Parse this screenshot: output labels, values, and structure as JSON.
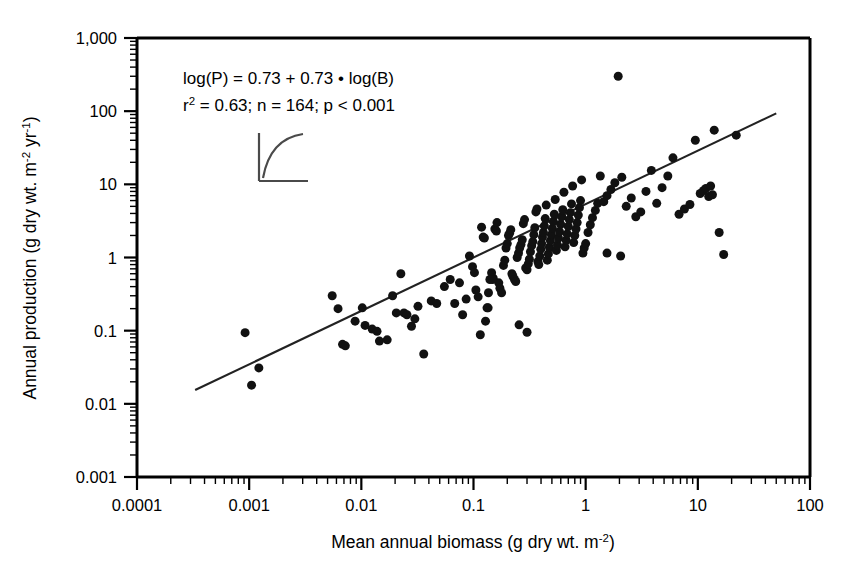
{
  "figure": {
    "background_color": "#ffffff",
    "ink_color": "#000000"
  },
  "annotation": {
    "equation": "log(P) = 0.73 + 0.73 • log(B)",
    "stats_r2_label": "r",
    "stats_r2_exponent": "2",
    "stats_rest": " = 0.63; n = 164; p < 0.001",
    "stats_full": "r2 = 0.63; n = 164; p < 0.001"
  },
  "inset": {
    "name": "saturating-curve-inset",
    "description": "small axes with a saturating (decelerating) curve"
  },
  "chart_data": {
    "type": "scatter",
    "title": "",
    "xlabel_parts": {
      "main": "Mean annual biomass (g dry wt. m",
      "exp": "-2",
      "tail": ")"
    },
    "ylabel_parts": {
      "main": "Annual production (g dry wt. m",
      "exp1": "-2",
      "mid": " yr",
      "exp2": "-1",
      "tail": ")"
    },
    "xlabel": "Mean annual biomass (g dry wt. m-2)",
    "ylabel": "Annual production (g dry wt. m-2 yr-1)",
    "xscale": "log",
    "yscale": "log",
    "xlim": [
      0.0001,
      100
    ],
    "ylim": [
      0.001,
      1000
    ],
    "xticks": [
      0.0001,
      0.001,
      0.01,
      0.1,
      1,
      10,
      100
    ],
    "xtick_labels": [
      "0.0001",
      "0.001",
      "0.01",
      "0.1",
      "1",
      "10",
      "100"
    ],
    "yticks": [
      0.001,
      0.01,
      0.1,
      1,
      10,
      100,
      1000
    ],
    "ytick_labels": [
      "0.001",
      "0.01",
      "0.1",
      "1",
      "10",
      "100",
      "1,000"
    ],
    "grid": false,
    "legend": false,
    "minor_ticks": true,
    "marker": {
      "shape": "circle",
      "color": "#111111",
      "size_px": 9
    },
    "fit_line": {
      "name": "regression-line",
      "equation": "log(P) = 0.73 + 0.73 * log(B)",
      "intercept": 0.73,
      "slope": 0.73,
      "r2": 0.63,
      "n": 164,
      "p": "< 0.001",
      "x_start": 0.00033,
      "x_end": 50.0,
      "color": "#222222"
    },
    "points": [
      [
        0.00092,
        0.094
      ],
      [
        0.00105,
        0.018
      ],
      [
        0.00122,
        0.031
      ],
      [
        0.0055,
        0.3
      ],
      [
        0.0062,
        0.2
      ],
      [
        0.0068,
        0.065
      ],
      [
        0.0072,
        0.062
      ],
      [
        0.0088,
        0.135
      ],
      [
        0.0102,
        0.205
      ],
      [
        0.0108,
        0.118
      ],
      [
        0.0125,
        0.105
      ],
      [
        0.0138,
        0.098
      ],
      [
        0.0145,
        0.072
      ],
      [
        0.017,
        0.075
      ],
      [
        0.019,
        0.3
      ],
      [
        0.0205,
        0.175
      ],
      [
        0.0225,
        0.6
      ],
      [
        0.024,
        0.175
      ],
      [
        0.0255,
        0.165
      ],
      [
        0.028,
        0.115
      ],
      [
        0.03,
        0.145
      ],
      [
        0.032,
        0.215
      ],
      [
        0.036,
        0.048
      ],
      [
        0.042,
        0.255
      ],
      [
        0.047,
        0.235
      ],
      [
        0.055,
        0.4
      ],
      [
        0.062,
        0.5
      ],
      [
        0.068,
        0.235
      ],
      [
        0.075,
        0.45
      ],
      [
        0.08,
        0.165
      ],
      [
        0.086,
        0.27
      ],
      [
        0.092,
        1.05
      ],
      [
        0.098,
        0.75
      ],
      [
        0.102,
        0.62
      ],
      [
        0.105,
        0.36
      ],
      [
        0.11,
        0.29
      ],
      [
        0.115,
        0.088
      ],
      [
        0.118,
        2.6
      ],
      [
        0.122,
        1.9
      ],
      [
        0.125,
        1.85
      ],
      [
        0.128,
        0.135
      ],
      [
        0.132,
        0.205
      ],
      [
        0.136,
        0.33
      ],
      [
        0.14,
        0.5
      ],
      [
        0.145,
        0.62
      ],
      [
        0.15,
        0.52
      ],
      [
        0.155,
        2.45
      ],
      [
        0.16,
        2.3
      ],
      [
        0.162,
        3.0
      ],
      [
        0.168,
        0.45
      ],
      [
        0.172,
        0.38
      ],
      [
        0.178,
        0.33
      ],
      [
        0.185,
        0.78
      ],
      [
        0.19,
        0.92
      ],
      [
        0.195,
        1.35
      ],
      [
        0.2,
        1.55
      ],
      [
        0.205,
        2.0
      ],
      [
        0.21,
        2.15
      ],
      [
        0.215,
        2.4
      ],
      [
        0.22,
        0.6
      ],
      [
        0.225,
        0.55
      ],
      [
        0.232,
        0.5
      ],
      [
        0.238,
        0.47
      ],
      [
        0.245,
        1.0
      ],
      [
        0.252,
        1.15
      ],
      [
        0.258,
        1.35
      ],
      [
        0.265,
        1.5
      ],
      [
        0.272,
        1.75
      ],
      [
        0.278,
        2.9
      ],
      [
        0.285,
        3.3
      ],
      [
        0.292,
        0.72
      ],
      [
        0.3,
        0.68
      ],
      [
        0.308,
        0.82
      ],
      [
        0.315,
        0.95
      ],
      [
        0.322,
        1.2
      ],
      [
        0.33,
        1.45
      ],
      [
        0.338,
        1.65
      ],
      [
        0.345,
        2.05
      ],
      [
        0.352,
        2.55
      ],
      [
        0.36,
        4.2
      ],
      [
        0.368,
        4.6
      ],
      [
        0.375,
        0.88
      ],
      [
        0.382,
        0.8
      ],
      [
        0.39,
        1.05
      ],
      [
        0.398,
        1.3
      ],
      [
        0.405,
        1.55
      ],
      [
        0.412,
        1.9
      ],
      [
        0.42,
        2.2
      ],
      [
        0.428,
        2.7
      ],
      [
        0.436,
        3.4
      ],
      [
        0.445,
        5.2
      ],
      [
        0.455,
        0.92
      ],
      [
        0.465,
        1.12
      ],
      [
        0.475,
        1.38
      ],
      [
        0.485,
        1.7
      ],
      [
        0.495,
        2.05
      ],
      [
        0.505,
        2.5
      ],
      [
        0.515,
        3.1
      ],
      [
        0.525,
        3.9
      ],
      [
        0.535,
        6.2
      ],
      [
        0.548,
        1.25
      ],
      [
        0.56,
        1.48
      ],
      [
        0.572,
        1.85
      ],
      [
        0.585,
        2.25
      ],
      [
        0.598,
        2.85
      ],
      [
        0.612,
        3.6
      ],
      [
        0.625,
        4.5
      ],
      [
        0.64,
        7.8
      ],
      [
        0.655,
        1.4
      ],
      [
        0.67,
        1.72
      ],
      [
        0.685,
        2.1
      ],
      [
        0.7,
        2.65
      ],
      [
        0.715,
        3.3
      ],
      [
        0.732,
        4.1
      ],
      [
        0.748,
        5.4
      ],
      [
        0.765,
        9.5
      ],
      [
        0.782,
        1.6
      ],
      [
        0.8,
        2.0
      ],
      [
        0.82,
        2.45
      ],
      [
        0.84,
        3.0
      ],
      [
        0.86,
        3.8
      ],
      [
        0.88,
        4.8
      ],
      [
        0.9,
        6.0
      ],
      [
        0.92,
        11.5
      ],
      [
        0.945,
        1.15
      ],
      [
        0.97,
        1.35
      ],
      [
        1.0,
        1.55
      ],
      [
        1.05,
        2.2
      ],
      [
        1.1,
        2.8
      ],
      [
        1.15,
        3.5
      ],
      [
        1.22,
        4.4
      ],
      [
        1.28,
        5.5
      ],
      [
        1.35,
        13.0
      ],
      [
        1.45,
        5.8
      ],
      [
        1.55,
        7.0
      ],
      [
        1.68,
        8.5
      ],
      [
        1.82,
        10.5
      ],
      [
        1.95,
        300.0
      ],
      [
        2.1,
        12.5
      ],
      [
        2.3,
        5.0
      ],
      [
        2.55,
        6.5
      ],
      [
        2.8,
        3.6
      ],
      [
        3.1,
        4.2
      ],
      [
        3.45,
        8.0
      ],
      [
        3.85,
        15.5
      ],
      [
        4.3,
        5.5
      ],
      [
        4.8,
        9.0
      ],
      [
        5.4,
        13.0
      ],
      [
        6.0,
        23.0
      ],
      [
        6.8,
        3.9
      ],
      [
        7.6,
        4.6
      ],
      [
        8.5,
        5.3
      ],
      [
        9.5,
        40.0
      ],
      [
        10.5,
        7.5
      ],
      [
        11.2,
        8.2
      ],
      [
        11.8,
        8.8
      ],
      [
        12.5,
        6.8
      ],
      [
        13.0,
        9.5
      ],
      [
        13.5,
        7.2
      ],
      [
        14.0,
        55.0
      ],
      [
        15.5,
        2.2
      ],
      [
        17.0,
        1.1
      ],
      [
        22.0,
        47.0
      ],
      [
        0.135,
        0.205
      ],
      [
        0.148,
        0.5
      ],
      [
        0.255,
        0.12
      ],
      [
        0.3,
        0.095
      ],
      [
        1.55,
        1.15
      ],
      [
        2.05,
        1.05
      ]
    ]
  }
}
